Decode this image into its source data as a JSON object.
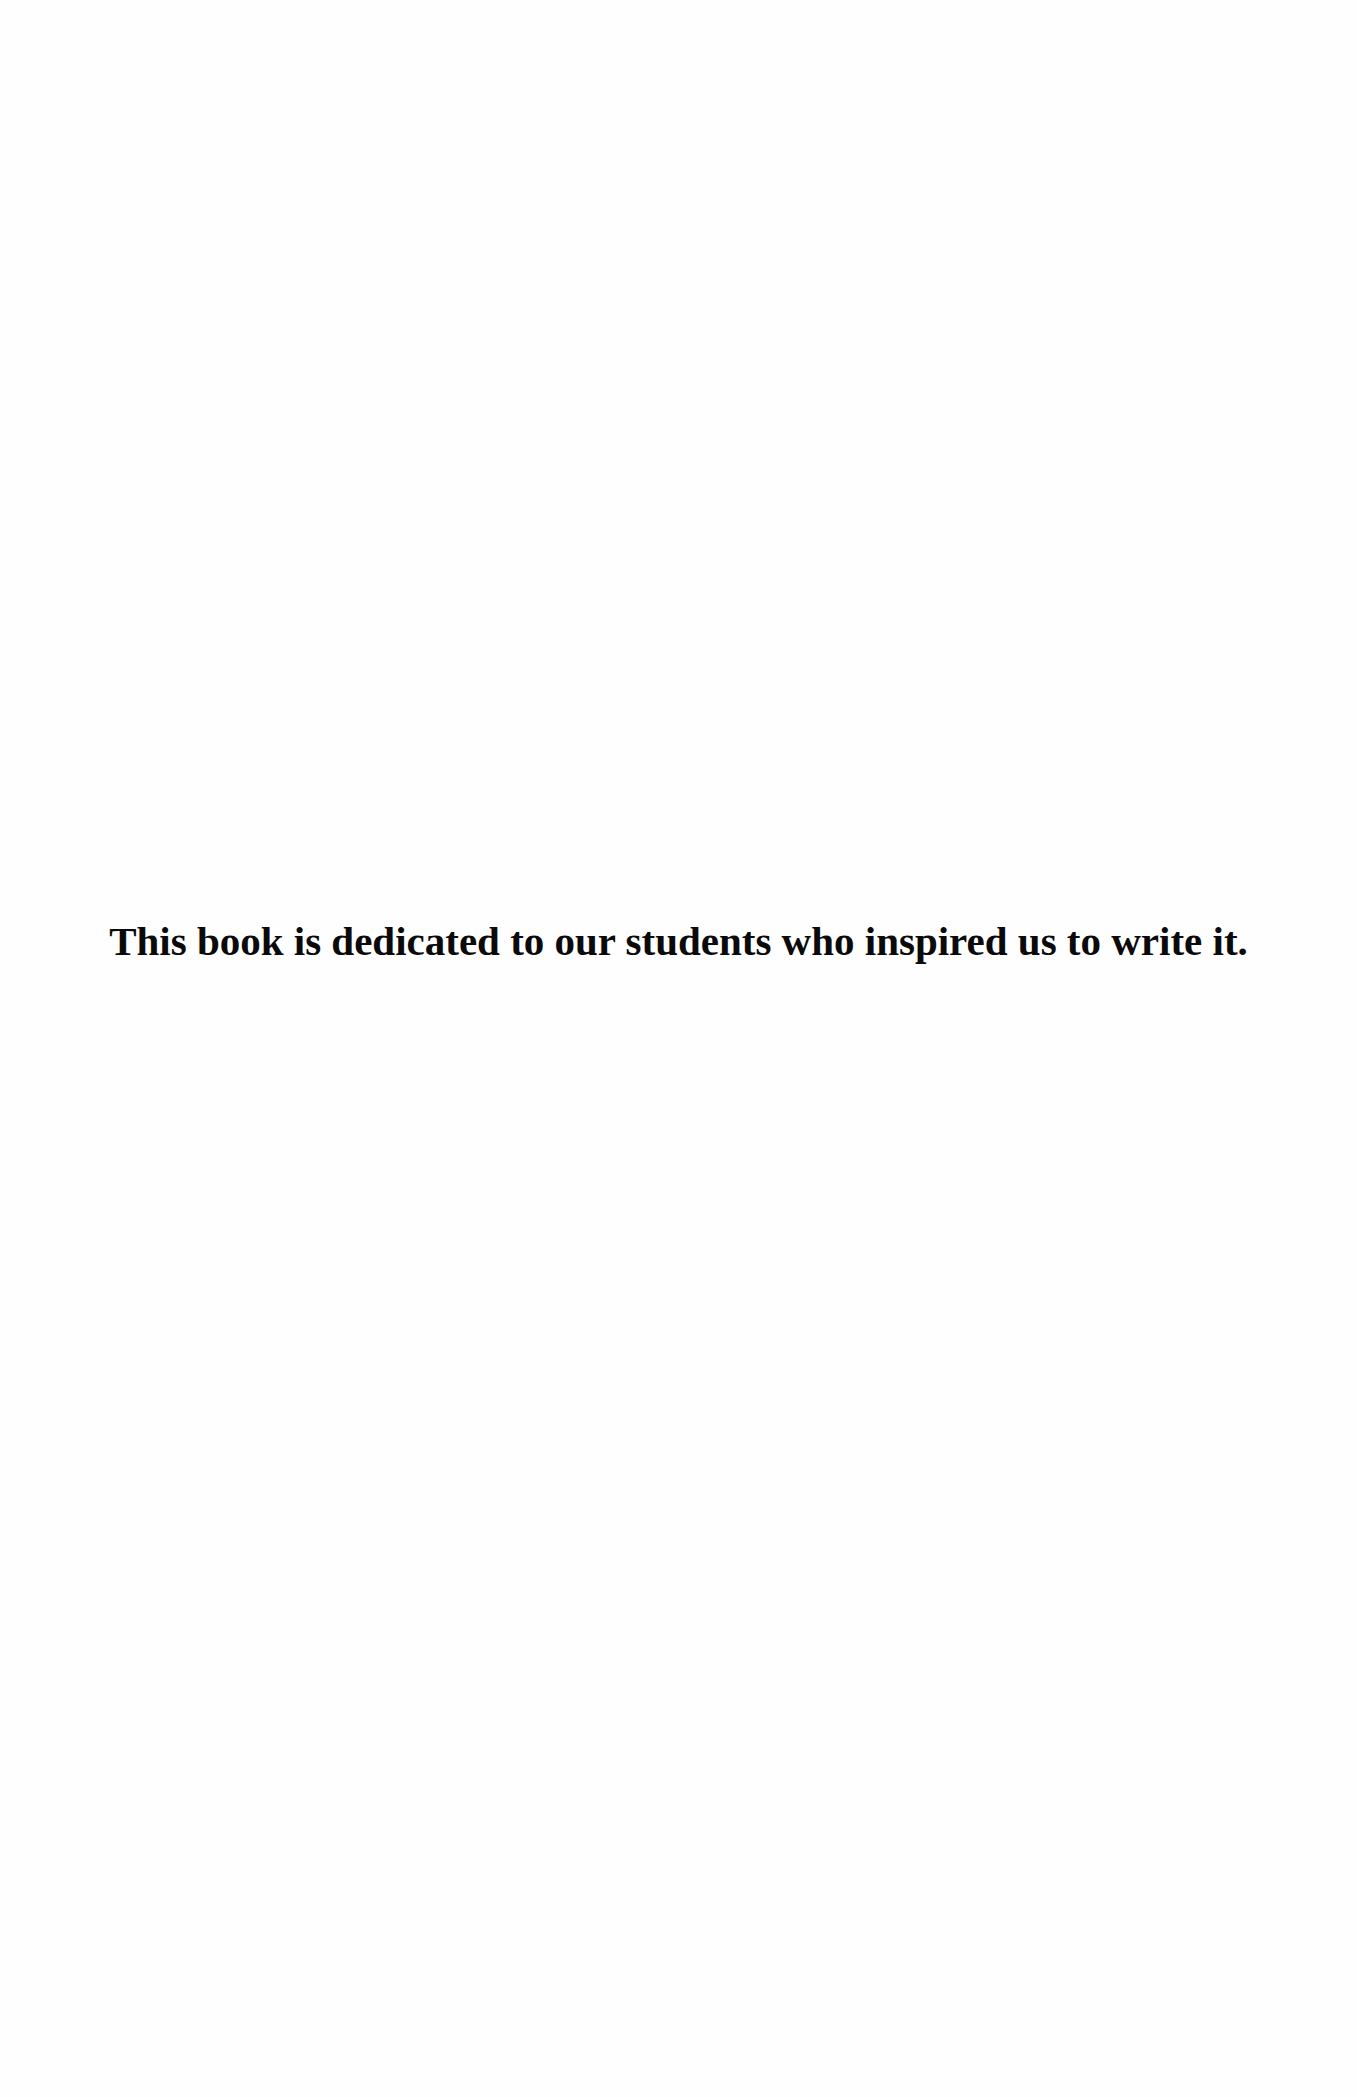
{
  "page": {
    "type": "dedication",
    "background_color": "#fefefe",
    "text_color": "#0a0a0a"
  },
  "dedication": {
    "text": "This book is dedicated to our students who inspired us to write it."
  }
}
